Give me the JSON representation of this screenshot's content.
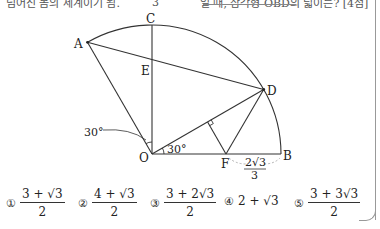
{
  "header": {
    "text_left": "넘어진 봄의 세계이기 됨.",
    "text_frac_den": "3",
    "text_right": "일 때, 삼각형 OBD의 넓이는? [4점]"
  },
  "figure": {
    "labels": {
      "A": "A",
      "C": "C",
      "E": "E",
      "D": "D",
      "O": "O",
      "F": "F",
      "B": "B",
      "angle_left": "30°",
      "angle_bottom": "30°",
      "fb_num": "2√3",
      "fb_den": "3"
    }
  },
  "choices": [
    {
      "marker": "①",
      "num": "3 + √3",
      "den": "2"
    },
    {
      "marker": "②",
      "num": "4 + √3",
      "den": "2"
    },
    {
      "marker": "③",
      "num": "3 + 2√3",
      "den": "2"
    },
    {
      "marker": "④",
      "text": "2 + √3"
    },
    {
      "marker": "⑤",
      "num": "3 + 3√3",
      "den": "2"
    }
  ]
}
